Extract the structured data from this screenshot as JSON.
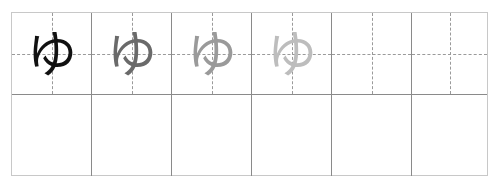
{
  "worksheet": {
    "character": "ゆ",
    "romaji_hidden": true,
    "columns": 6,
    "rows": 2,
    "trace_row": [
      {
        "glyph": "ゆ",
        "color": "#111111",
        "role": "model"
      },
      {
        "glyph": "ゆ",
        "color": "#6a6a6a",
        "role": "trace-dark"
      },
      {
        "glyph": "ゆ",
        "color": "#9a9a9a",
        "role": "trace-medium"
      },
      {
        "glyph": "ゆ",
        "color": "#bdbdbd",
        "role": "trace-light"
      },
      {
        "glyph": "",
        "color": "",
        "role": "blank-guided"
      },
      {
        "glyph": "",
        "color": "",
        "role": "blank-guided"
      }
    ],
    "practice_row": [
      {
        "glyph": ""
      },
      {
        "glyph": ""
      },
      {
        "glyph": ""
      },
      {
        "glyph": ""
      },
      {
        "glyph": ""
      },
      {
        "glyph": ""
      }
    ],
    "colors": {
      "cell_border": "#8a8a8a",
      "outer_border": "#c8c8c8",
      "guide_dashes": "#9a9a9a"
    }
  }
}
